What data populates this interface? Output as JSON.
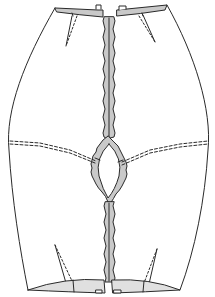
{
  "diagram": {
    "type": "garment-pattern-line-drawing",
    "colors": {
      "background": "#ffffff",
      "line": "#2a2a2a",
      "fill_gray": "#c9c9c9"
    },
    "parts": [
      {
        "name": "top-waistband-left"
      },
      {
        "name": "top-waistband-right"
      },
      {
        "name": "left-side-outline"
      },
      {
        "name": "right-side-outline"
      },
      {
        "name": "center-zipper-strip"
      },
      {
        "name": "diamond-opening"
      },
      {
        "name": "horizontal-seam-left"
      },
      {
        "name": "horizontal-seam-right"
      },
      {
        "name": "dart-top-left"
      },
      {
        "name": "dart-top-right"
      },
      {
        "name": "dart-bottom-left"
      },
      {
        "name": "dart-bottom-right"
      },
      {
        "name": "bottom-band-left"
      },
      {
        "name": "bottom-band-right"
      }
    ],
    "text_labels": []
  }
}
